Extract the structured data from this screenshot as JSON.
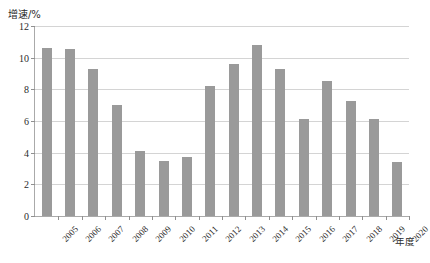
{
  "chart_data": {
    "type": "bar",
    "title": "",
    "xlabel": "年度",
    "ylabel": "增速/%",
    "ylim": [
      0,
      12
    ],
    "yticks": [
      0,
      2,
      4,
      6,
      8,
      10,
      12
    ],
    "ytick_labels": [
      "0",
      "2",
      "4",
      "6",
      "8",
      "10",
      "12"
    ],
    "grid": true,
    "legend": "none",
    "bar_color": "#9a9a9a",
    "gridline_color": "#d4d4d4",
    "axis_color": "#aaaaaa",
    "categories": [
      "2005",
      "2006",
      "2007",
      "2008",
      "2009",
      "2010",
      "2011",
      "2012",
      "2013",
      "2014",
      "2015",
      "2016",
      "2017",
      "2018",
      "2019",
      "2020"
    ],
    "values": [
      10.6,
      10.55,
      9.3,
      7.0,
      4.1,
      3.5,
      3.7,
      8.2,
      9.6,
      10.8,
      9.3,
      6.1,
      8.5,
      7.25,
      6.1,
      3.4
    ]
  },
  "axis": {
    "y_title": "增速/%",
    "x_title": "年度"
  },
  "caption": ""
}
